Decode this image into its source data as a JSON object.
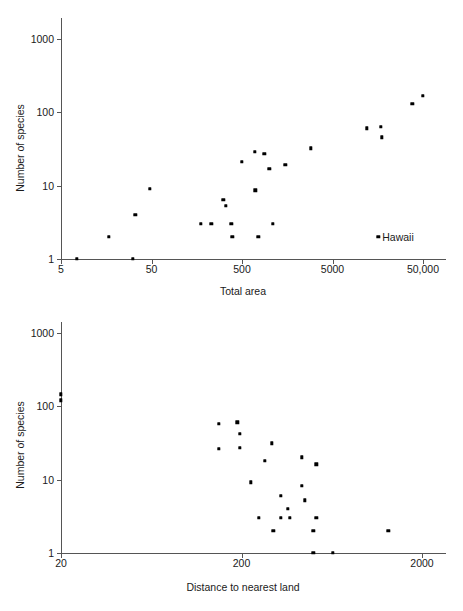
{
  "page": {
    "background": "#ffffff",
    "point_color": "#000000",
    "axis_color": "#555555",
    "text_color": "#1a1a1a"
  },
  "figures": [
    {
      "name": "species-vs-area",
      "y_axis_title": "Number of species",
      "x_axis_title": "Total area",
      "x_tick_labels": [
        "5",
        "50",
        "500",
        "5000",
        "50,000"
      ],
      "y_tick_labels": [
        "1",
        "10",
        "100",
        "1000"
      ],
      "annotation": "Hawaii"
    },
    {
      "name": "species-vs-distance",
      "y_axis_title": "Number of species",
      "x_axis_title": "Distance to nearest land",
      "x_tick_labels": [
        "20",
        "200",
        "2000"
      ],
      "y_tick_labels": [
        "1",
        "10",
        "100",
        "1000"
      ]
    }
  ],
  "chart_data": [
    {
      "type": "scatter",
      "title": "",
      "xlabel": "Total area",
      "ylabel": "Number of species",
      "xscale": "log",
      "yscale": "log",
      "xlim": [
        5,
        100000
      ],
      "ylim": [
        1,
        2000
      ],
      "xticks": [
        5,
        50,
        500,
        5000,
        50000
      ],
      "xticklabels": [
        "5",
        "50",
        "500",
        "5000",
        "50,000"
      ],
      "yticks": [
        1,
        10,
        100,
        1000
      ],
      "yticklabels": [
        "1",
        "10",
        "100",
        "1000"
      ],
      "grid": false,
      "legend": "none",
      "points": [
        {
          "x": 7.5,
          "y": 1
        },
        {
          "x": 17,
          "y": 2
        },
        {
          "x": 31,
          "y": 1
        },
        {
          "x": 33,
          "y": 4
        },
        {
          "x": 48,
          "y": 9
        },
        {
          "x": 175,
          "y": 3
        },
        {
          "x": 230,
          "y": 3
        },
        {
          "x": 310,
          "y": 6.4
        },
        {
          "x": 330,
          "y": 5.3
        },
        {
          "x": 380,
          "y": 3
        },
        {
          "x": 390,
          "y": 2
        },
        {
          "x": 500,
          "y": 21
        },
        {
          "x": 690,
          "y": 29
        },
        {
          "x": 700,
          "y": 8.6
        },
        {
          "x": 760,
          "y": 2
        },
        {
          "x": 880,
          "y": 27
        },
        {
          "x": 1000,
          "y": 17
        },
        {
          "x": 1100,
          "y": 3
        },
        {
          "x": 1500,
          "y": 19
        },
        {
          "x": 2900,
          "y": 32
        },
        {
          "x": 12000,
          "y": 60
        },
        {
          "x": 16000,
          "y": 2,
          "label": "Hawaii"
        },
        {
          "x": 17000,
          "y": 63
        },
        {
          "x": 17500,
          "y": 45
        },
        {
          "x": 38000,
          "y": 130
        },
        {
          "x": 50000,
          "y": 165
        }
      ],
      "annotations": [
        {
          "text": "Hawaii",
          "x": 16000,
          "y": 2
        }
      ]
    },
    {
      "type": "scatter",
      "title": "",
      "xlabel": "Distance to nearest land",
      "ylabel": "Number of species",
      "xscale": "log",
      "yscale": "log",
      "xlim": [
        20,
        4000
      ],
      "ylim": [
        1,
        2000
      ],
      "xticks": [
        20,
        200,
        2000
      ],
      "xticklabels": [
        "20",
        "200",
        "2000"
      ],
      "yticks": [
        1,
        10,
        100,
        1000
      ],
      "yticklabels": [
        "1",
        "10",
        "100",
        "1000"
      ],
      "grid": false,
      "legend": "none",
      "points": [
        {
          "x": 20,
          "y": 145
        },
        {
          "x": 20,
          "y": 120
        },
        {
          "x": 150,
          "y": 57
        },
        {
          "x": 190,
          "y": 60
        },
        {
          "x": 195,
          "y": 42
        },
        {
          "x": 150,
          "y": 26
        },
        {
          "x": 195,
          "y": 27
        },
        {
          "x": 295,
          "y": 31
        },
        {
          "x": 270,
          "y": 18
        },
        {
          "x": 430,
          "y": 20
        },
        {
          "x": 520,
          "y": 16
        },
        {
          "x": 225,
          "y": 9.2
        },
        {
          "x": 430,
          "y": 8.2
        },
        {
          "x": 330,
          "y": 6
        },
        {
          "x": 450,
          "y": 5.2
        },
        {
          "x": 360,
          "y": 4
        },
        {
          "x": 250,
          "y": 3
        },
        {
          "x": 330,
          "y": 3
        },
        {
          "x": 370,
          "y": 3
        },
        {
          "x": 520,
          "y": 3
        },
        {
          "x": 300,
          "y": 2
        },
        {
          "x": 500,
          "y": 2
        },
        {
          "x": 1300,
          "y": 2
        },
        {
          "x": 500,
          "y": 1
        },
        {
          "x": 640,
          "y": 1
        }
      ],
      "annotations": []
    }
  ]
}
